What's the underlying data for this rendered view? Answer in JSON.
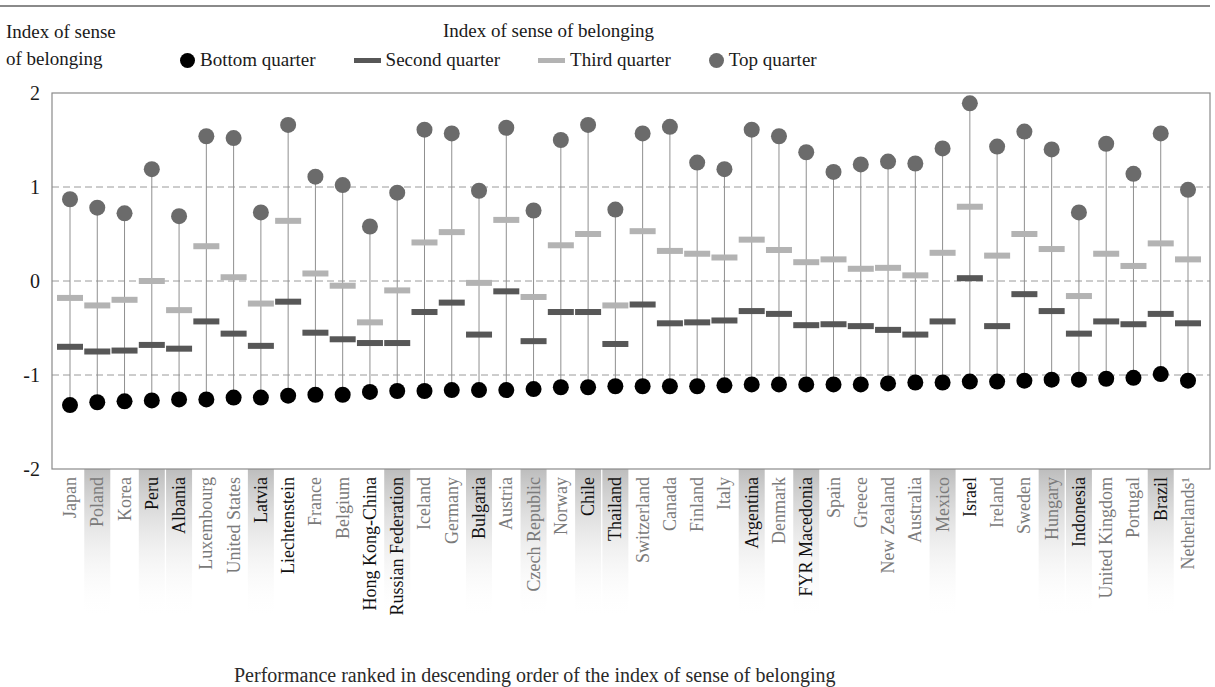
{
  "header": {
    "y_axis_label_line1": "Index of sense",
    "y_axis_label_line2": "of belonging",
    "legend_title": "Index of sense of belonging"
  },
  "legend": [
    {
      "label": "Bottom quarter",
      "symbol": "black-dot"
    },
    {
      "label": "Second quarter",
      "symbol": "dark-grey-bar"
    },
    {
      "label": "Third quarter",
      "symbol": "light-grey-bar"
    },
    {
      "label": "Top quarter",
      "symbol": "grey-dot"
    }
  ],
  "caption": "Performance ranked in descending order of the index of sense of belonging",
  "colors": {
    "bottom": "#000000",
    "second": "#575757",
    "third": "#b3b3b3",
    "top": "#6b6b6b",
    "stem": "#8f8f8f",
    "gridline": "#9a9a9a",
    "shade": "#bdbdbd",
    "oecd_label": "#7a7a7a",
    "partner_label": "#111111"
  },
  "chart_data": {
    "type": "dot-range",
    "title": "Index of sense of belonging",
    "ylabel": "Index of sense of belonging",
    "xlabel": "",
    "ylim": [
      -2,
      2
    ],
    "yticks": [
      2,
      1,
      0,
      -1,
      -2
    ],
    "grid": {
      "dashed_y": [
        1,
        0,
        -1
      ]
    },
    "legend_position": "top",
    "categories": [
      "Japan",
      "Poland",
      "Korea",
      "Peru",
      "Albania",
      "Luxembourg",
      "United States",
      "Latvia",
      "Liechtenstein",
      "France",
      "Belgium",
      "Hong Kong-China",
      "Russian Federation",
      "Iceland",
      "Germany",
      "Bulgaria",
      "Austria",
      "Czech Republic",
      "Norway",
      "Chile",
      "Thailand",
      "Switzerland",
      "Canada",
      "Finland",
      "Italy",
      "Argentina",
      "Denmark",
      "FYR Macedonia",
      "Spain",
      "Greece",
      "New Zealand",
      "Australia",
      "Mexico",
      "Israel",
      "Ireland",
      "Sweden",
      "Hungary",
      "Indonesia",
      "United Kingdom",
      "Portugal",
      "Brazil",
      "Netherlands¹"
    ],
    "shaded": [
      "Poland",
      "Peru",
      "Albania",
      "Latvia",
      "Russian Federation",
      "Bulgaria",
      "Czech Republic",
      "Chile",
      "Thailand",
      "Argentina",
      "FYR Macedonia",
      "Mexico",
      "Hungary",
      "Indonesia",
      "Brazil"
    ],
    "partner_bold": [
      "Peru",
      "Albania",
      "Latvia",
      "Liechtenstein",
      "Hong Kong-China",
      "Russian Federation",
      "Bulgaria",
      "Chile",
      "Thailand",
      "Argentina",
      "FYR Macedonia",
      "Israel",
      "Indonesia",
      "Brazil"
    ],
    "series": [
      {
        "name": "Bottom quarter",
        "marker": "circle",
        "values": [
          -1.32,
          -1.29,
          -1.28,
          -1.27,
          -1.26,
          -1.26,
          -1.24,
          -1.24,
          -1.22,
          -1.21,
          -1.21,
          -1.18,
          -1.17,
          -1.17,
          -1.16,
          -1.16,
          -1.16,
          -1.15,
          -1.13,
          -1.13,
          -1.12,
          -1.12,
          -1.12,
          -1.12,
          -1.11,
          -1.1,
          -1.1,
          -1.1,
          -1.1,
          -1.1,
          -1.09,
          -1.08,
          -1.08,
          -1.07,
          -1.07,
          -1.06,
          -1.05,
          -1.05,
          -1.04,
          -1.03,
          -0.99,
          -1.06
        ]
      },
      {
        "name": "Second quarter",
        "marker": "bar",
        "values": [
          -0.7,
          -0.75,
          -0.74,
          -0.68,
          -0.72,
          -0.43,
          -0.56,
          -0.69,
          -0.22,
          -0.55,
          -0.62,
          -0.66,
          -0.66,
          -0.33,
          -0.23,
          -0.57,
          -0.11,
          -0.64,
          -0.33,
          -0.33,
          -0.67,
          -0.25,
          -0.45,
          -0.44,
          -0.42,
          -0.32,
          -0.35,
          -0.47,
          -0.46,
          -0.48,
          -0.52,
          -0.57,
          -0.43,
          0.03,
          -0.48,
          -0.14,
          -0.32,
          -0.56,
          -0.43,
          -0.46,
          -0.35,
          -0.45
        ]
      },
      {
        "name": "Third quarter",
        "marker": "bar",
        "values": [
          -0.18,
          -0.26,
          -0.2,
          0.0,
          -0.31,
          0.37,
          0.04,
          -0.24,
          0.64,
          0.08,
          -0.05,
          -0.44,
          -0.1,
          0.41,
          0.52,
          -0.02,
          0.65,
          -0.17,
          0.38,
          0.5,
          -0.26,
          0.53,
          0.32,
          0.29,
          0.25,
          0.44,
          0.33,
          0.2,
          0.23,
          0.13,
          0.14,
          0.06,
          0.3,
          0.79,
          0.27,
          0.5,
          0.34,
          -0.16,
          0.29,
          0.16,
          0.4,
          0.23
        ]
      },
      {
        "name": "Top quarter",
        "marker": "circle",
        "values": [
          0.87,
          0.78,
          0.72,
          1.19,
          0.69,
          1.54,
          1.52,
          0.73,
          1.66,
          1.11,
          1.02,
          0.58,
          0.94,
          1.61,
          1.57,
          0.96,
          1.63,
          0.75,
          1.5,
          1.66,
          0.76,
          1.57,
          1.64,
          1.26,
          1.19,
          1.61,
          1.54,
          1.37,
          1.16,
          1.24,
          1.27,
          1.25,
          1.41,
          1.89,
          1.43,
          1.59,
          1.4,
          0.73,
          1.46,
          1.14,
          1.57,
          0.97
        ]
      }
    ]
  }
}
